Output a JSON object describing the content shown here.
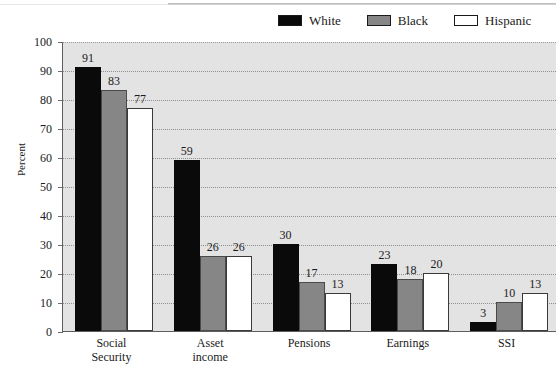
{
  "chart_data": {
    "type": "bar",
    "title": "",
    "subtitle": "",
    "xlabel": "",
    "ylabel": "Percent",
    "ylim": [
      0,
      100
    ],
    "ytick_step": 10,
    "yticks": [
      0,
      10,
      20,
      30,
      40,
      50,
      60,
      70,
      80,
      90,
      100
    ],
    "grid": true,
    "grid_style": "dotted-horizontal",
    "legend_position": "top-right",
    "categories": [
      "Social\nSecurity",
      "Asset\nincome",
      "Pensions",
      "Earnings",
      "SSI"
    ],
    "series": [
      {
        "name": "White",
        "color": "#0a0a0a",
        "values": [
          91,
          59,
          30,
          23,
          3
        ]
      },
      {
        "name": "Black",
        "color": "#868686",
        "values": [
          83,
          26,
          17,
          18,
          10
        ]
      },
      {
        "name": "Hispanic",
        "color": "#ffffff",
        "values": [
          77,
          26,
          13,
          20,
          13
        ]
      }
    ],
    "data_labels": true,
    "plot_background": "#e3e3e3"
  },
  "legend": {
    "items": [
      {
        "label": "White",
        "swatch": "legend-swatch-black-fill"
      },
      {
        "label": "Black",
        "swatch": "legend-swatch-gray-fill"
      },
      {
        "label": "Hispanic",
        "swatch": "legend-swatch-white-fill"
      }
    ]
  },
  "axes": {
    "y_title": "Percent"
  }
}
